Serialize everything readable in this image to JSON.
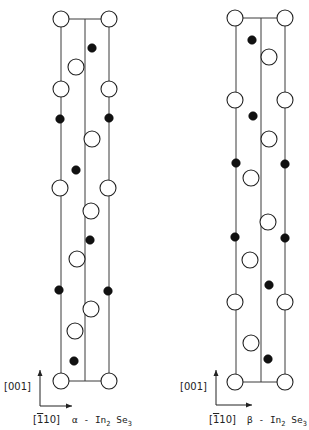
{
  "figure": {
    "width": 309,
    "height": 430,
    "colors": {
      "background": "#ffffff",
      "line": "#3a3a3a",
      "atom_fill_dark": "#111111",
      "atom_fill_open": "#ffffff"
    },
    "legend_note": "open circles and filled circles denote two atom species"
  },
  "structures": [
    {
      "id": "alpha",
      "title_prefix": "α - In",
      "title_sub1": "2",
      "title_mid": " Se",
      "title_sub2": "3",
      "frame": {
        "x_left": 61,
        "x_mid": 85,
        "x_right": 109,
        "y_top": 19,
        "y_bottom": 381
      },
      "axes": {
        "vertical_label": "[001]",
        "horizontal_label": "[110]",
        "horizontal_label_overbar_index": 1,
        "origin": [
          40,
          406
        ],
        "up_end": [
          40,
          370
        ],
        "right_end": [
          72,
          406
        ]
      },
      "open_atoms": [
        [
          61,
          19
        ],
        [
          109,
          19
        ],
        [
          76,
          67
        ],
        [
          61,
          89
        ],
        [
          109,
          89
        ],
        [
          92,
          139
        ],
        [
          60,
          188
        ],
        [
          108,
          188
        ],
        [
          91,
          211
        ],
        [
          77,
          259
        ],
        [
          91,
          309
        ],
        [
          75,
          331
        ],
        [
          61,
          381
        ],
        [
          109,
          381
        ]
      ],
      "filled_atoms": [
        [
          92,
          48
        ],
        [
          60,
          119
        ],
        [
          109,
          118
        ],
        [
          76,
          170
        ],
        [
          90,
          240
        ],
        [
          59,
          290
        ],
        [
          108,
          291
        ],
        [
          74,
          361
        ]
      ]
    },
    {
      "id": "beta",
      "title_prefix": "β - In",
      "title_sub1": "2",
      "title_mid": " Se",
      "title_sub2": "3",
      "frame": {
        "x_left": 236,
        "x_mid": 261,
        "x_right": 285,
        "y_top": 18,
        "y_bottom": 382
      },
      "axes": {
        "vertical_label": "[001]",
        "horizontal_label": "[110]",
        "horizontal_label_overbar_index": 1,
        "origin": [
          216,
          405
        ],
        "up_end": [
          216,
          370
        ],
        "right_end": [
          252,
          405
        ]
      },
      "open_atoms": [
        [
          235,
          18
        ],
        [
          285,
          18
        ],
        [
          269,
          57
        ],
        [
          235,
          100
        ],
        [
          285,
          100
        ],
        [
          269,
          139
        ],
        [
          251,
          178
        ],
        [
          268,
          222
        ],
        [
          250,
          260
        ],
        [
          235,
          302
        ],
        [
          285,
          302
        ],
        [
          251,
          343
        ],
        [
          235,
          382
        ],
        [
          285,
          382
        ]
      ],
      "filled_atoms": [
        [
          252,
          40
        ],
        [
          253,
          116
        ],
        [
          236,
          163
        ],
        [
          285,
          164
        ],
        [
          235,
          237
        ],
        [
          285,
          238
        ],
        [
          269,
          285
        ],
        [
          268,
          359
        ]
      ]
    }
  ]
}
